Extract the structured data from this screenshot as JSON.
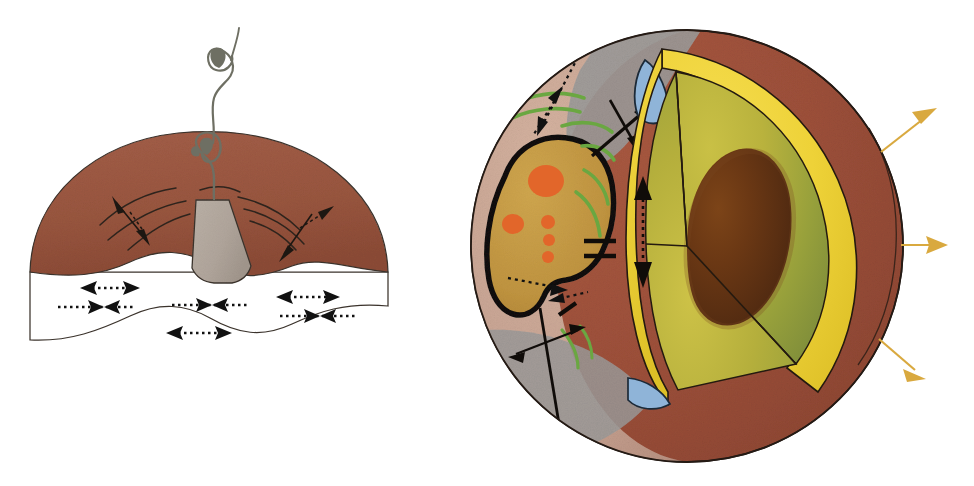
{
  "figure": {
    "title": "Planetary interior and surface volcanism schematic",
    "background_color": "#ffffff",
    "width": 974,
    "height": 486,
    "panels": [
      {
        "id": "left-panel",
        "name": "volcanic-edifice-cross-section",
        "caption": "",
        "bounds": {
          "x": 20,
          "y": 30,
          "width": 400,
          "height": 320
        }
      },
      {
        "id": "right-panel",
        "name": "planet-cutaway-sphere",
        "caption": "",
        "bounds": {
          "x": 450,
          "y": 25,
          "width": 475,
          "height": 445
        }
      }
    ]
  },
  "colors": {
    "mantle_brown": "#9c5a44",
    "mantle_brown_dark": "#8a4c38",
    "crust_outer_brown": "#a0503a",
    "crust_outer_brown_shade": "#8d4431",
    "cone_gray": "#b2a79d",
    "cone_gray_dark": "#9b9088",
    "plume_gray": "#6e6f63",
    "surface_tan": "#c9a694",
    "surface_gray_blue": "#9c9a9a",
    "ochre_patch": "#c49a46",
    "ochre_patch_dark": "#b08a38",
    "orange_spot": "#e2662a",
    "green_arc": "#6aa741",
    "yellow_mantle": "#f0d23a",
    "yellow_mantle_shade": "#dcbc25",
    "interior_olive": "#b7b23a",
    "interior_olive_dark": "#7d8b3e",
    "core_brown": "#5c3016",
    "core_brown_mid": "#8a4a1e",
    "blue_patch": "#8fb4d8",
    "flux_arrow_gold": "#d9a93f",
    "outline_black": "#1a1510",
    "white": "#ffffff"
  },
  "left_panel": {
    "name": "volcano-cross-section",
    "layers": [
      {
        "name": "mantle-layer",
        "label": "mantle",
        "color": "#9c5a44"
      },
      {
        "name": "asthenosphere-layer",
        "label": "interior white layer",
        "color": "#ffffff"
      }
    ],
    "features": [
      {
        "name": "volcanic-cone",
        "label": "volcanic edifice",
        "color": "#b2a79d"
      },
      {
        "name": "eruption-plume",
        "label": "eruption plume",
        "color": "#6e6f63",
        "eddies": 2
      },
      {
        "name": "mantle-flow-arcs",
        "label": "mantle flow lines",
        "count": 6
      },
      {
        "name": "solid-arrow-pair-left",
        "label": "extension arrow left"
      },
      {
        "name": "solid-arrow-pair-right",
        "label": "extension arrow right"
      }
    ],
    "dotted_arrows": [
      {
        "name": "flow-arrow-upper-left",
        "direction": "double",
        "x": 95,
        "y": 265
      },
      {
        "name": "flow-arrow-mid-left",
        "direction": "converging",
        "x": 85,
        "y": 290
      },
      {
        "name": "flow-arrow-center",
        "direction": "converging",
        "x": 200,
        "y": 289
      },
      {
        "name": "flow-arrow-upper-right",
        "direction": "double",
        "x": 295,
        "y": 272
      },
      {
        "name": "flow-arrow-mid-right",
        "direction": "converging",
        "x": 300,
        "y": 295
      },
      {
        "name": "flow-arrow-bottom-center",
        "direction": "double",
        "x": 195,
        "y": 318
      }
    ]
  },
  "right_panel": {
    "name": "planet-cutaway",
    "sphere": {
      "cx": 687,
      "cy": 246,
      "r": 216
    },
    "shells": [
      {
        "name": "outer-crust-shell",
        "label": "crust",
        "color": "#a0503a"
      },
      {
        "name": "yellow-mantle-shell",
        "label": "mantle",
        "color": "#f0d23a"
      },
      {
        "name": "interior-olive",
        "label": "lower mantle",
        "color": "#b7b23a"
      },
      {
        "name": "core",
        "label": "core",
        "color": "#5c3016"
      }
    ],
    "surface_features": [
      {
        "name": "ochre-hotspot-region",
        "label": "hotspot province",
        "color": "#c49a46"
      },
      {
        "name": "orange-vent-spots",
        "label": "volcanic vents",
        "count": 7,
        "color": "#e2662a"
      },
      {
        "name": "green-arc-ridges",
        "label": "ridge arcs",
        "count": 8,
        "color": "#6aa741"
      },
      {
        "name": "black-tick-marks",
        "label": "fault ticks",
        "count": 6,
        "color": "#1a1510"
      },
      {
        "name": "blue-patch-upper",
        "label": "polar/ocean patch",
        "color": "#8fb4d8"
      },
      {
        "name": "blue-patch-lower",
        "label": "polar/ocean patch",
        "color": "#8fb4d8"
      },
      {
        "name": "gray-terrain-patch",
        "label": "highland terrain",
        "color": "#9c9a9a"
      },
      {
        "name": "double-bar-marks",
        "label": "parallel bar symbols",
        "count": 2
      }
    ],
    "annotation_arrows": [
      {
        "name": "dotted-arrow-upper-left",
        "style": "dotted",
        "heads": 1
      },
      {
        "name": "solid-arrow-upper-crossing",
        "style": "solid",
        "heads": 2
      },
      {
        "name": "dotted-arrow-vertical-mantle",
        "style": "dotted",
        "heads": 2
      },
      {
        "name": "dotted-arrow-lower-left",
        "style": "dotted",
        "heads": 2
      },
      {
        "name": "solid-arrow-lower-crossing",
        "style": "solid",
        "heads": 2
      }
    ],
    "radiation_arrows": [
      {
        "name": "heat-flux-arrow-top",
        "color": "#d9a93f",
        "angle_deg": -35
      },
      {
        "name": "heat-flux-arrow-middle",
        "color": "#d9a93f",
        "angle_deg": 0
      },
      {
        "name": "heat-flux-arrow-bottom",
        "color": "#d9a93f",
        "angle_deg": 35
      }
    ]
  }
}
